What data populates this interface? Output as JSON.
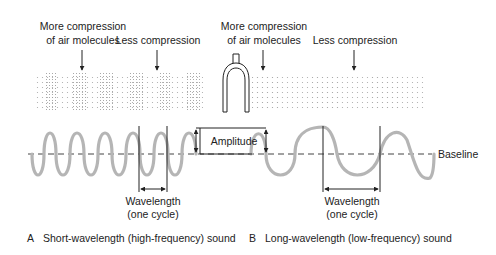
{
  "panel_a": {
    "label_more_line1": "More compression",
    "label_more_line2": "of air molecules",
    "label_less": "Less compression",
    "wavelength_line1": "Wavelength",
    "wavelength_line2": "(one cycle)",
    "caption_letter": "A",
    "caption": "Short-wavelength (high-frequency) sound"
  },
  "panel_b": {
    "label_more_line1": "More compression",
    "label_more_line2": "of air molecules",
    "label_less": "Less compression",
    "wavelength_line1": "Wavelength",
    "wavelength_line2": "(one cycle)",
    "caption_letter": "B",
    "caption": "Long-wavelength (low-frequency) sound"
  },
  "center": {
    "amplitude_label": "Amplitude",
    "baseline_label": "Baseline",
    "tuning_fork": "tuning-fork-icon"
  },
  "colors": {
    "wave": "#b5b5b5",
    "ink": "#222222",
    "dots": "#9a9a9a"
  }
}
